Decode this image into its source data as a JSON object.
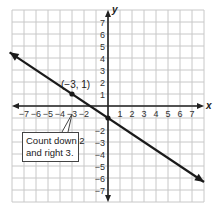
{
  "chart_data": {
    "type": "line",
    "title": "",
    "xlabel": "x",
    "ylabel": "y",
    "xlim": [
      -8,
      8
    ],
    "ylim": [
      -8,
      8
    ],
    "grid": true,
    "x_tick_labels": [
      "−7",
      "−6",
      "−5",
      "−4",
      "−3",
      "−2",
      "1",
      "2",
      "3",
      "4",
      "5",
      "6",
      "7"
    ],
    "y_tick_labels": [
      "7",
      "6",
      "5",
      "4",
      "3",
      "2",
      "1",
      "−2",
      "−3",
      "−4",
      "−5",
      "−6",
      "−7"
    ],
    "series": [
      {
        "name": "line",
        "equation": "y = -2/3 x - 1",
        "slope": -0.6667,
        "y_intercept": -1,
        "arrow_both_ends": true,
        "x": [
          -8.2,
          -3,
          0,
          8
        ],
        "y": [
          4.47,
          1,
          -1,
          -6.33
        ]
      }
    ],
    "points": [
      {
        "label": "(−3, 1)",
        "x": -3,
        "y": 1
      },
      {
        "label": "",
        "x": 0,
        "y": -1
      }
    ],
    "annotations": [
      {
        "text": "Count down 2 and right 3.",
        "points_to": [
          -3,
          0
        ]
      }
    ]
  },
  "labels": {
    "x_axis": "x",
    "y_axis": "y",
    "point": "(−3, 1)",
    "callout_line1": "Count down 2",
    "callout_line2": "and right 3."
  },
  "colors": {
    "grid": "#c8c8c8",
    "axis": "#222222",
    "line": "#1a1a1a"
  }
}
